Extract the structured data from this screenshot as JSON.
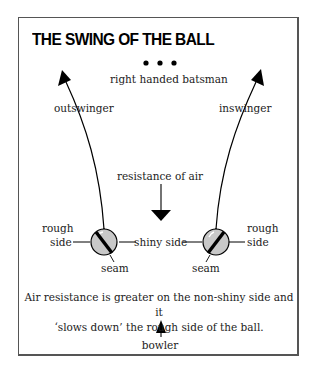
{
  "title": "THE SWING OF THE BALL",
  "labels": {
    "batsman": "right handed batsman",
    "outswinger": "outswinger",
    "inswinger": "inswinger",
    "resistance": "resistance of air",
    "rough_left_1": "rough",
    "rough_left_2": "side",
    "rough_right_1": "rough",
    "rough_right_2": "side",
    "shiny": "shiny side",
    "seam_left": "seam",
    "seam_right": "seam",
    "bowler": "bowler"
  },
  "caption": {
    "line1": "Air resistance is greater on the non-shiny side and it",
    "line2": "‘slows down’ the rough side of the ball."
  },
  "colors": {
    "ball_fill": "#c8c8c8",
    "ink": "#000000",
    "frame": "#555555"
  }
}
